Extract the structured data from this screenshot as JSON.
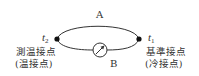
{
  "diagram": {
    "wire_a_label": "A",
    "wire_b_label": "B",
    "left_junction": {
      "temp_symbol": "t",
      "temp_subscript": "2",
      "name": "測温接点",
      "alt_name": "(温接点)"
    },
    "right_junction": {
      "temp_symbol": "t",
      "temp_subscript": "1",
      "name": "基準接点",
      "alt_name": "(冷接点)"
    },
    "meter": "galvanometer-icon"
  },
  "colors": {
    "line": "#333333",
    "dot": "#111111",
    "background": "#ffffff"
  }
}
